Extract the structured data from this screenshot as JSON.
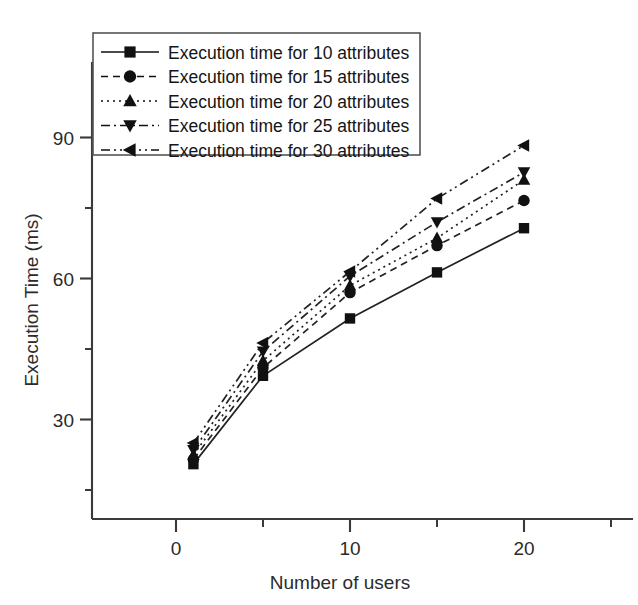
{
  "chart_data": {
    "type": "line",
    "title": "",
    "subtitle": "",
    "xlabel": "Number of users",
    "ylabel": "Execution Time (ms)",
    "x": [
      1,
      5,
      10,
      15,
      20
    ],
    "xlim": [
      -3,
      23
    ],
    "ylim": [
      10,
      97
    ],
    "xticks": [
      0,
      10,
      20
    ],
    "xticklabels": [
      "0",
      "10",
      "20"
    ],
    "xminorticks": [
      5,
      15
    ],
    "yticks": [
      30,
      60,
      90
    ],
    "yticklabels": [
      "30",
      "60",
      "90"
    ],
    "yminorticks": [
      15,
      45,
      75
    ],
    "grid": false,
    "legend_position": "top-left",
    "series": [
      {
        "name": "Execution time for 10 attributes",
        "marker": "square",
        "linestyle": "solid",
        "color": "#111111",
        "values": [
          20.5,
          39.3,
          51.5,
          61.3,
          70.7
        ]
      },
      {
        "name": "Execution time for 15 attributes",
        "marker": "circle",
        "linestyle": "dashed",
        "color": "#111111",
        "values": [
          21.5,
          41.0,
          57.0,
          67.0,
          76.6
        ]
      },
      {
        "name": "Execution time for 20 attributes",
        "marker": "triangle-up",
        "linestyle": "dotted",
        "color": "#111111",
        "values": [
          22.5,
          42.5,
          58.5,
          68.6,
          81.0
        ]
      },
      {
        "name": "Execution time for 25 attributes",
        "marker": "triangle-down",
        "linestyle": "dash-dot",
        "color": "#111111",
        "values": [
          23.5,
          44.5,
          60.5,
          72.0,
          82.6
        ]
      },
      {
        "name": "Execution time for 30 attributes",
        "marker": "triangle-left",
        "linestyle": "dash-dot-dot",
        "color": "#111111",
        "values": [
          25.0,
          46.3,
          61.5,
          77.0,
          88.3
        ]
      }
    ]
  },
  "legend": {
    "entries": [
      {
        "label": "Execution time for 10 attributes"
      },
      {
        "label": "Execution time for 15 attributes"
      },
      {
        "label": "Execution time for 20 attributes"
      },
      {
        "label": "Execution time for 25 attributes"
      },
      {
        "label": "Execution time for 30 attributes"
      }
    ]
  },
  "axes": {
    "x_title": "Number of users",
    "y_title": "Execution Time (ms)",
    "x_tick_0": "0",
    "x_tick_1": "10",
    "x_tick_2": "20",
    "y_tick_0": "30",
    "y_tick_1": "60",
    "y_tick_2": "90"
  }
}
